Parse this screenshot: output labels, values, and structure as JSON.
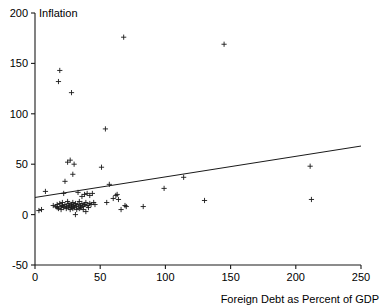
{
  "chart_data": {
    "type": "scatter",
    "title": "",
    "xlabel": "Foreign Debt as Percent of GDP",
    "ylabel": "Inflation",
    "xlim": [
      0,
      250
    ],
    "ylim": [
      -50,
      200
    ],
    "xticks": [
      0,
      50,
      100,
      150,
      200,
      250
    ],
    "yticks": [
      -50,
      0,
      50,
      100,
      150,
      200
    ],
    "xtick_labels": [
      "0",
      "50",
      "100",
      "150",
      "200",
      "250"
    ],
    "ytick_labels": [
      "-50",
      "0",
      "50",
      "100",
      "150",
      "200"
    ],
    "grid": false,
    "legend": "none",
    "marker": "plus",
    "marker_color": "#1a1a1a",
    "series": [
      {
        "name": "Countries",
        "points": [
          [
            3,
            4
          ],
          [
            5,
            5
          ],
          [
            8,
            23
          ],
          [
            14,
            9
          ],
          [
            16,
            8
          ],
          [
            17,
            10
          ],
          [
            17,
            7
          ],
          [
            18,
            6
          ],
          [
            18,
            132
          ],
          [
            19,
            143
          ],
          [
            19,
            11
          ],
          [
            20,
            8
          ],
          [
            20,
            5
          ],
          [
            21,
            12
          ],
          [
            21,
            9
          ],
          [
            22,
            7
          ],
          [
            22,
            21
          ],
          [
            23,
            33
          ],
          [
            23,
            10
          ],
          [
            24,
            8
          ],
          [
            24,
            6
          ],
          [
            25,
            52
          ],
          [
            25,
            13
          ],
          [
            26,
            11
          ],
          [
            26,
            9
          ],
          [
            26,
            7
          ],
          [
            27,
            54
          ],
          [
            27,
            5
          ],
          [
            28,
            121
          ],
          [
            28,
            10
          ],
          [
            28,
            8
          ],
          [
            29,
            40
          ],
          [
            29,
            6
          ],
          [
            29,
            12
          ],
          [
            30,
            50
          ],
          [
            30,
            9
          ],
          [
            30,
            7
          ],
          [
            31,
            0
          ],
          [
            31,
            11
          ],
          [
            32,
            5
          ],
          [
            32,
            8
          ],
          [
            33,
            22
          ],
          [
            33,
            10
          ],
          [
            34,
            6
          ],
          [
            34,
            13
          ],
          [
            35,
            9
          ],
          [
            35,
            7
          ],
          [
            36,
            18
          ],
          [
            36,
            11
          ],
          [
            37,
            8
          ],
          [
            37,
            5
          ],
          [
            38,
            20
          ],
          [
            38,
            10
          ],
          [
            39,
            3
          ],
          [
            39,
            12
          ],
          [
            40,
            21
          ],
          [
            40,
            9
          ],
          [
            41,
            7
          ],
          [
            42,
            19
          ],
          [
            42,
            11
          ],
          [
            43,
            10
          ],
          [
            44,
            21
          ],
          [
            45,
            12
          ],
          [
            46,
            10
          ],
          [
            51,
            47
          ],
          [
            54,
            85
          ],
          [
            55,
            12
          ],
          [
            57,
            30
          ],
          [
            60,
            16
          ],
          [
            62,
            19
          ],
          [
            63,
            20
          ],
          [
            64,
            15
          ],
          [
            66,
            5
          ],
          [
            68,
            176
          ],
          [
            69,
            9
          ],
          [
            70,
            8
          ],
          [
            83,
            8
          ],
          [
            99,
            26
          ],
          [
            114,
            37
          ],
          [
            130,
            14
          ],
          [
            145,
            169
          ],
          [
            211,
            48
          ],
          [
            212,
            15
          ]
        ]
      }
    ],
    "trendline": {
      "name": "Linear fit",
      "x_start": 0,
      "y_start": 17,
      "x_end": 250,
      "y_end": 68
    }
  }
}
